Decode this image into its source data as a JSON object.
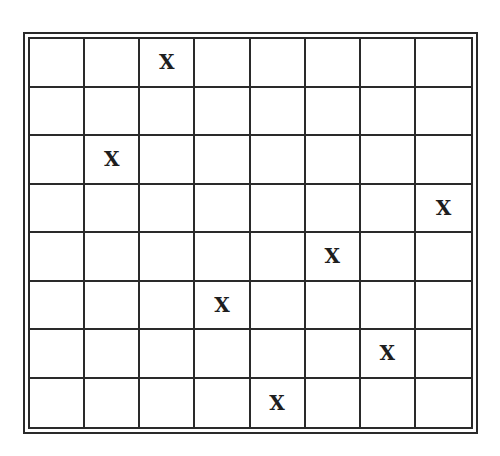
{
  "diagram": {
    "type": "grid",
    "rows": 8,
    "cols": 8,
    "mark_symbol": "X",
    "line_color": "#2a2a2a",
    "marks": [
      {
        "row": 0,
        "col": 2
      },
      {
        "row": 2,
        "col": 1
      },
      {
        "row": 3,
        "col": 7
      },
      {
        "row": 4,
        "col": 5
      },
      {
        "row": 5,
        "col": 3
      },
      {
        "row": 6,
        "col": 6
      },
      {
        "row": 7,
        "col": 4
      }
    ],
    "cells": [
      [
        "",
        "",
        "X",
        "",
        "",
        "",
        "",
        ""
      ],
      [
        "",
        "",
        "",
        "",
        "",
        "",
        "",
        ""
      ],
      [
        "",
        "X",
        "",
        "",
        "",
        "",
        "",
        ""
      ],
      [
        "",
        "",
        "",
        "",
        "",
        "",
        "",
        "X"
      ],
      [
        "",
        "",
        "",
        "",
        "",
        "X",
        "",
        ""
      ],
      [
        "",
        "",
        "",
        "X",
        "",
        "",
        "",
        ""
      ],
      [
        "",
        "",
        "",
        "",
        "",
        "",
        "X",
        ""
      ],
      [
        "",
        "",
        "",
        "",
        "X",
        "",
        "",
        ""
      ]
    ]
  }
}
